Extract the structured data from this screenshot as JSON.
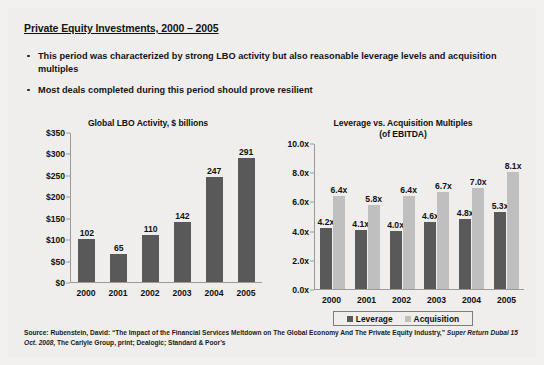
{
  "slide": {
    "title": "Private Equity Investments, 2000 – 2005",
    "bullets": [
      "This period was characterized by strong LBO activity but also reasonable leverage levels and acquisition multiples",
      "Most deals completed during this period should prove resilient"
    ],
    "source_line_1": "Source: Rubenstein, David: “The Impact of the Financial Services Meltdown on The Global Economy And The Private Equity",
    "source_line_2_pre": "Industry,” ",
    "source_line_2_em": "Super Return Dubai 15 Oct. 2008",
    "source_line_2_post": ", The Carlyle Group, print; Dealogic; Standard & Poor’s"
  },
  "colors": {
    "leverage_bar": "#595959",
    "acquisition_bar": "#BFBFBF",
    "background": "#EFEEEC",
    "text": "#111111"
  },
  "chart_data": [
    {
      "type": "bar",
      "id": "global-lbo-activity",
      "title": "Global LBO Activity, $ billions",
      "xlabel": "",
      "ylabel": "",
      "categories": [
        "2000",
        "2001",
        "2002",
        "2003",
        "2004",
        "2005"
      ],
      "values": [
        102,
        65,
        110,
        142,
        247,
        291
      ],
      "data_labels": [
        "102",
        "65",
        "110",
        "142",
        "247",
        "291"
      ],
      "ylim": [
        0,
        350
      ],
      "yticks": [
        0,
        50,
        100,
        150,
        200,
        250,
        300,
        350
      ],
      "ytick_labels": [
        "$0",
        "$50",
        "$100",
        "$150",
        "$200",
        "$250",
        "$300",
        "$350"
      ],
      "grid": false,
      "legend": "none"
    },
    {
      "type": "bar",
      "id": "leverage-vs-acquisition-multiples",
      "title": "Leverage vs. Acquisition Multiples",
      "subtitle": "(of EBITDA)",
      "xlabel": "",
      "ylabel": "",
      "categories": [
        "2000",
        "2001",
        "2002",
        "2003",
        "2004",
        "2005"
      ],
      "series": [
        {
          "name": "Leverage",
          "color": "#595959",
          "values": [
            4.2,
            4.1,
            4.0,
            4.6,
            4.8,
            5.3
          ],
          "data_labels": [
            "4.2x",
            "4.1x",
            "4.0x",
            "4.6x",
            "4.8x",
            "5.3x"
          ]
        },
        {
          "name": "Acquisition",
          "color": "#BFBFBF",
          "values": [
            6.4,
            5.8,
            6.4,
            6.7,
            7.0,
            8.1
          ],
          "data_labels": [
            "6.4x",
            "5.8x",
            "6.4x",
            "6.7x",
            "7.0x",
            "8.1x"
          ]
        }
      ],
      "ylim": [
        0,
        10
      ],
      "yticks": [
        0,
        2,
        4,
        6,
        8,
        10
      ],
      "ytick_labels": [
        "0.0x",
        "2.0x",
        "4.0x",
        "6.0x",
        "8.0x",
        "10.0x"
      ],
      "grid": false,
      "legend": "bottom"
    }
  ]
}
